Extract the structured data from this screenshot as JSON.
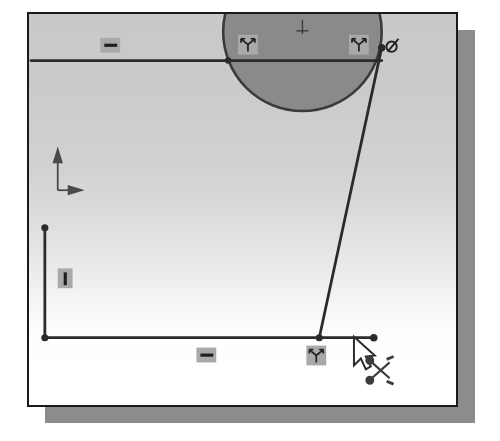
{
  "app": {
    "context": "cad-sketch-viewport",
    "tool_active": "trim-entities",
    "cursor_icon": "arrow-scissors-cursor"
  },
  "viewport": {
    "name": "graphics-window",
    "frame": {
      "x": 27,
      "y": 12,
      "width": 431,
      "height": 395
    },
    "shadow": {
      "x": 45,
      "y": 30,
      "width": 430,
      "height": 393
    },
    "border_color": "#1a1a1a",
    "shadow_color": "#8c8c8c",
    "background_top_color": "#c9c9c9",
    "background_bottom_color": "#ffffff"
  },
  "origin_indicator": {
    "name": "origin-axis-tripod",
    "x": 56,
    "y": 152,
    "y_axis_label": "Y",
    "x_axis_label": "X",
    "color": "#4a4a4a"
  },
  "sketch": {
    "entity_color": "#2b2b2b",
    "entity_width": 2.6,
    "endpoint_color": "#2b2b2b",
    "circle_fill_color": "#8a8a8a",
    "entities": [
      {
        "name": "top-horizontal-line",
        "type": "line",
        "x1": 29,
        "y1": 59,
        "x2": 383,
        "y2": 59
      },
      {
        "name": "bottom-horizontal-line",
        "type": "line",
        "x1": 43,
        "y1": 339,
        "x2": 375,
        "y2": 339
      },
      {
        "name": "left-vertical-line",
        "type": "line",
        "x1": 43,
        "y1": 228,
        "x2": 43,
        "y2": 339
      },
      {
        "name": "slanted-line",
        "type": "line",
        "x1": 383,
        "y1": 46,
        "x2": 320,
        "y2": 339
      },
      {
        "name": "selected-circle",
        "type": "circle",
        "cx": 303,
        "cy": 30,
        "r": 80,
        "filled": true
      }
    ],
    "points": [
      {
        "name": "endpoint-vertical-top",
        "x": 43,
        "y": 228
      },
      {
        "name": "endpoint-corner-bottom-left",
        "x": 43,
        "y": 339
      },
      {
        "name": "endpoint-slant-bottom",
        "x": 320,
        "y": 339
      },
      {
        "name": "endpoint-line-right",
        "x": 375,
        "y": 339
      },
      {
        "name": "endpoint-slant-top",
        "x": 383,
        "y": 46
      },
      {
        "name": "endpoint-circle-left-quadrant",
        "x": 228,
        "y": 59
      }
    ],
    "circle_center_mark": {
      "name": "circle-center-cross",
      "x": 303,
      "y": 26
    }
  },
  "constraint_glyphs": [
    {
      "name": "horizontal-constraint-top",
      "icon": "horizontal-constraint-icon",
      "x": 99,
      "y": 36,
      "w": 20,
      "h": 15
    },
    {
      "name": "coincident-constraint-circle-left",
      "icon": "coincident-constraint-icon",
      "x": 238,
      "y": 33,
      "w": 20,
      "h": 20
    },
    {
      "name": "coincident-constraint-circle-right",
      "icon": "coincident-constraint-icon",
      "x": 350,
      "y": 33,
      "w": 20,
      "h": 20
    },
    {
      "name": "tangent-constraint",
      "icon": "tangent-constraint-icon",
      "x": 389,
      "y": 33,
      "w": 20,
      "h": 20
    },
    {
      "name": "vertical-constraint-left",
      "icon": "vertical-constraint-icon",
      "x": 56,
      "y": 269,
      "w": 15,
      "h": 20
    },
    {
      "name": "horizontal-constraint-bottom",
      "icon": "horizontal-constraint-icon",
      "x": 196,
      "y": 349,
      "w": 20,
      "h": 15
    },
    {
      "name": "coincident-constraint-bottom",
      "icon": "coincident-constraint-icon",
      "x": 307,
      "y": 347,
      "w": 20,
      "h": 20
    }
  ],
  "cursor": {
    "name": "trim-cursor",
    "x": 355,
    "y": 338,
    "pointer_icon": "arrow-pointer-icon",
    "tool_icon": "scissors-icon",
    "color": "#3d3d3d"
  }
}
